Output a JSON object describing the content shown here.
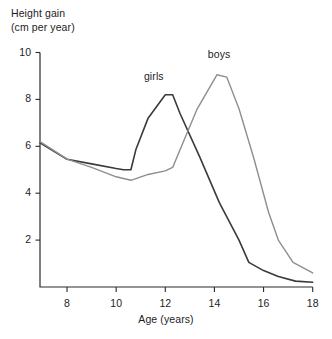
{
  "chart_data": {
    "type": "line",
    "title": "",
    "ylabel": "Height gain\n(cm per year)",
    "ylabel_line1": "Height gain",
    "ylabel_line2": "(cm per year)",
    "xlabel": "Age (years)",
    "xlim": [
      6.9,
      18
    ],
    "ylim": [
      0,
      10
    ],
    "grid": false,
    "legend_position": "inline-annotations",
    "yticks": [
      10,
      8,
      6,
      4,
      2
    ],
    "ytick_labels": [
      "10",
      "8",
      "6",
      "4",
      "2"
    ],
    "xticks": [
      8,
      10,
      12,
      14,
      16,
      18
    ],
    "xtick_labels": [
      "8",
      "10",
      "12",
      "14",
      "16",
      "18"
    ],
    "annotations": [
      {
        "text": "girls",
        "x": 11.7,
        "y": 8.95
      },
      {
        "text": "boys",
        "x": 14.3,
        "y": 9.9
      }
    ],
    "series": [
      {
        "name": "girls",
        "color": "#3a3a3a",
        "width": 1.6,
        "x": [
          6.9,
          8.0,
          9.0,
          10.0,
          10.3,
          10.6,
          10.8,
          11.3,
          12.0,
          12.3,
          12.6,
          13.4,
          14.2,
          15.0,
          15.4,
          16.0,
          16.6,
          17.3,
          18.0
        ],
        "y": [
          6.15,
          5.45,
          5.25,
          5.05,
          5.0,
          5.0,
          5.85,
          7.2,
          8.2,
          8.2,
          7.4,
          5.55,
          3.6,
          2.0,
          1.05,
          0.7,
          0.45,
          0.25,
          0.2
        ]
      },
      {
        "name": "boys",
        "color": "#8e8e8e",
        "width": 1.4,
        "x": [
          6.9,
          8.0,
          9.0,
          10.0,
          10.6,
          11.3,
          12.0,
          12.3,
          12.6,
          13.3,
          14.1,
          14.5,
          15.0,
          15.6,
          16.2,
          16.6,
          17.2,
          18.0
        ],
        "y": [
          6.2,
          5.45,
          5.1,
          4.7,
          4.55,
          4.8,
          4.95,
          5.1,
          5.85,
          7.6,
          9.05,
          8.95,
          7.6,
          5.5,
          3.2,
          2.0,
          1.05,
          0.6
        ]
      }
    ]
  }
}
